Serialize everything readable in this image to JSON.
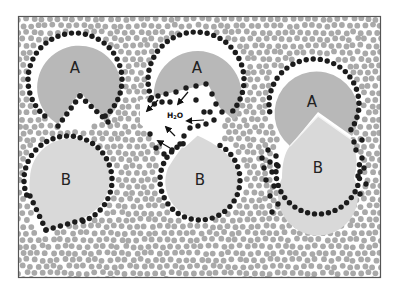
{
  "colors": {
    "background": "#ffffff",
    "frame": "#555555",
    "solvent_particle": "#a9a9a9",
    "boundary_particle": "#1c1c1c",
    "domain_a_fill": "#b8b8b8",
    "domain_b_fill": "#d9d9d9",
    "label_text": "#222222"
  },
  "frame": {
    "x": 18,
    "y": 16,
    "width": 363,
    "height": 262
  },
  "labels": {
    "a1": "A",
    "a2": "A",
    "a3": "A",
    "b1": "B",
    "b2": "B",
    "b3": "B",
    "water": "H2O",
    "water_main": "H",
    "water_sub": "2",
    "water_tail": "O"
  },
  "panels": [
    {
      "name": "domain-a-left",
      "label": "A",
      "type": "pacman",
      "cx": 75,
      "cy": 80
    },
    {
      "name": "domain-a-center",
      "label": "A",
      "type": "pacman-with-wedge-gap",
      "cx": 196,
      "cy": 80
    },
    {
      "name": "domain-a-right-merged",
      "label": "A",
      "type": "circle-merged-with-b",
      "cx": 314,
      "cy": 104
    },
    {
      "name": "domain-b-left",
      "label": "B",
      "type": "teardrop",
      "cx": 68,
      "cy": 180
    },
    {
      "name": "domain-b-center",
      "label": "B",
      "type": "teardrop",
      "cx": 200,
      "cy": 180
    },
    {
      "name": "domain-b-right-merged",
      "label": "B",
      "type": "teardrop-merged-with-a",
      "cx": 318,
      "cy": 168
    }
  ],
  "arrows": [
    {
      "x1": 158,
      "y1": 100,
      "x2": 147,
      "y2": 111
    },
    {
      "x1": 188,
      "y1": 92,
      "x2": 178,
      "y2": 104
    },
    {
      "x1": 204,
      "y1": 120,
      "x2": 187,
      "y2": 121
    },
    {
      "x1": 175,
      "y1": 136,
      "x2": 166,
      "y2": 127
    },
    {
      "x1": 170,
      "y1": 148,
      "x2": 158,
      "y2": 141
    }
  ]
}
